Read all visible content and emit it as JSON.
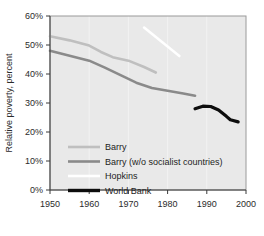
{
  "chart_data": {
    "type": "line",
    "title": "",
    "xlabel": "",
    "ylabel": "Relative poverty, percent",
    "xlim": [
      1950,
      2000
    ],
    "ylim": [
      0,
      60
    ],
    "x_ticks": [
      "1950",
      "1960",
      "1970",
      "1980",
      "1990",
      "2000"
    ],
    "y_ticks": [
      "0%",
      "10%",
      "20%",
      "30%",
      "40%",
      "50%",
      "60%"
    ],
    "grid": "vertical",
    "legend_position": "lower-left-inside",
    "series": [
      {
        "name": "Barry",
        "color": "#bfbfbf",
        "width": 2.6,
        "points": [
          [
            1950,
            53.0
          ],
          [
            1955,
            51.6
          ],
          [
            1960,
            49.8
          ],
          [
            1963,
            47.6
          ],
          [
            1966,
            45.8
          ],
          [
            1970,
            44.6
          ],
          [
            1974,
            42.4
          ],
          [
            1977,
            40.5
          ]
        ]
      },
      {
        "name": "Barry (w/o socialist countries)",
        "color": "#8a8a8a",
        "width": 2.6,
        "points": [
          [
            1950,
            48.0
          ],
          [
            1955,
            46.3
          ],
          [
            1960,
            44.6
          ],
          [
            1964,
            42.2
          ],
          [
            1968,
            39.6
          ],
          [
            1972,
            37.0
          ],
          [
            1976,
            35.2
          ],
          [
            1980,
            34.2
          ],
          [
            1984,
            33.3
          ],
          [
            1987,
            32.5
          ]
        ]
      },
      {
        "name": "Hopkins",
        "color": "#ffffff",
        "width": 2.6,
        "points": [
          [
            1974,
            56.0
          ],
          [
            1983,
            46.2
          ]
        ]
      },
      {
        "name": "World Bank",
        "color": "#0d0d0d",
        "width": 3.2,
        "points": [
          [
            1987,
            28.0
          ],
          [
            1989,
            28.9
          ],
          [
            1991,
            28.8
          ],
          [
            1993,
            27.6
          ],
          [
            1995,
            25.4
          ],
          [
            1996,
            24.2
          ],
          [
            1998,
            23.5
          ]
        ]
      }
    ]
  },
  "legend": {
    "items": [
      {
        "label": "Barry",
        "color": "#bfbfbf",
        "width": 2.6
      },
      {
        "label": "Barry (w/o socialist countries)",
        "color": "#8a8a8a",
        "width": 2.6
      },
      {
        "label": "Hopkins",
        "color": "#ffffff",
        "width": 2.6
      },
      {
        "label": "World Bank",
        "color": "#0d0d0d",
        "width": 3.4
      }
    ]
  }
}
